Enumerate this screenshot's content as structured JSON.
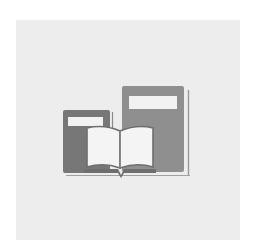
{
  "icon": {
    "name": "books-icon",
    "description": "Books with an open book in front",
    "colors": {
      "tile_background": "#ededed",
      "left_book": "#777777",
      "right_book": "#8f8f8f",
      "labels": "#f2f2f2",
      "pages": "#f4f4f4",
      "outline": "#6e6e6e",
      "base_line": "#9a9a9a"
    }
  }
}
